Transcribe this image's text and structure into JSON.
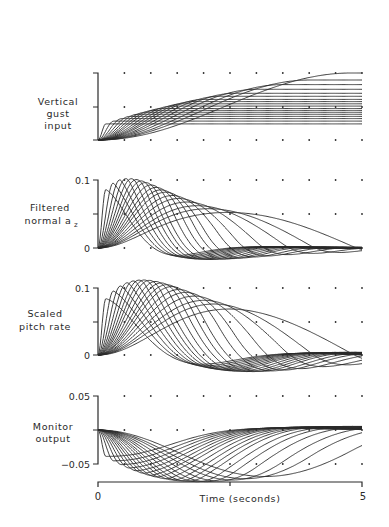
{
  "chart_data": {
    "type": "line",
    "title": "",
    "xlabel": "Time (seconds)",
    "x_range": [
      0,
      5
    ],
    "x_tick_labels": [
      "0",
      "5"
    ],
    "grid": "dots every 0.5 s",
    "family_note": "Each panel shows a family of ~18 responses to 1-cosine vertical gusts of increasing length (0.15 s to ~5 s)",
    "gust_lengths_s": [
      0.15,
      0.3,
      0.45,
      0.6,
      0.75,
      0.9,
      1.05,
      1.2,
      1.4,
      1.6,
      1.8,
      2.0,
      2.3,
      2.6,
      3.0,
      3.5,
      4.0,
      4.8
    ],
    "panels": [
      {
        "name": "vertical-gust-input",
        "ylabel": [
          "Vertical",
          "gust",
          "input"
        ],
        "y_tick_labels": [],
        "ylim": [
          0,
          1
        ],
        "description": "1-cosine ramps rising to plateaus; amplitude grows with gust length, longest reaches top at t=5 s"
      },
      {
        "name": "filtered-normal-az",
        "ylabel": [
          "Filtered",
          "normal a",
          "z"
        ],
        "y_tick_labels": [
          "0.1",
          "0"
        ],
        "ylim": [
          0,
          0.1
        ],
        "peak_value": 0.1,
        "peak_time_s": 1.0,
        "description": "Pulses peaking near 0.1 around t≈1 s, decaying with small negative undershoot"
      },
      {
        "name": "scaled-pitch-rate",
        "ylabel": [
          "Scaled",
          "pitch rate"
        ],
        "y_tick_labels": [
          "0.1",
          "0"
        ],
        "ylim": [
          0,
          0.1
        ],
        "peak_value": 0.11,
        "peak_time_s": 1.3,
        "description": "Pulses peaking above 0.1 around t≈1.3 s, with negative undershoot"
      },
      {
        "name": "monitor-output",
        "ylabel": [
          "Monitor",
          "output"
        ],
        "y_tick_labels": [
          "0.05",
          "-0.05"
        ],
        "ylim": [
          -0.05,
          0.05
        ],
        "min_value": -0.075,
        "min_time_s": 1.7,
        "description": "Negative dips to about -0.075 near t≈1.7 s, returning to slightly positive values"
      }
    ]
  },
  "labels": {
    "gust": [
      "Vertical",
      "gust",
      "input"
    ],
    "az": [
      "Filtered",
      "normal a"
    ],
    "az_sub": "z",
    "pitch": [
      "Scaled",
      "pitch rate"
    ],
    "monitor": [
      "Monitor",
      "output"
    ],
    "az_top": "0.1",
    "az_zero": "0",
    "pitch_top": "0.1",
    "pitch_zero": "0",
    "mon_top": "0.05",
    "mon_bottom": "−0.05",
    "x_start": "0",
    "x_end": "5",
    "x_title": "Time (seconds)"
  },
  "colors": {
    "ink": "#2a2a2a",
    "background": "#ffffff"
  }
}
